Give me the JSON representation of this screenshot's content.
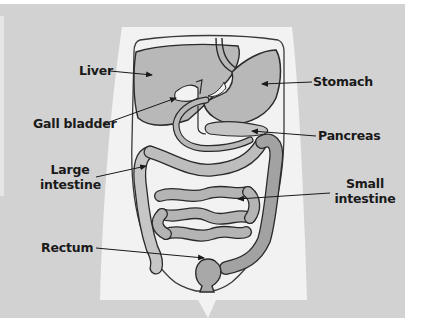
{
  "diagram": {
    "colors": {
      "panel_background": "#d2d2d2",
      "body_background": "#f2f2f2",
      "organ_fill": "#b8b8b8",
      "organ_fill_dark": "#a2a2a2",
      "outline": "#2a2a2a",
      "label_text": "#1a1a1a"
    },
    "labels": {
      "liver": "Liver",
      "gall_bladder": "Gall bladder",
      "large_intestine_line1": "Large",
      "large_intestine_line2": "intestine",
      "rectum": "Rectum",
      "stomach": "Stomach",
      "pancreas": "Pancreas",
      "small_intestine_line1": "Small",
      "small_intestine_line2": "intestine"
    }
  }
}
